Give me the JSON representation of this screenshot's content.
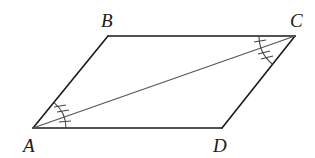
{
  "figure": {
    "type": "parallelogram",
    "vertices": {
      "A": {
        "label": "A",
        "x": 33,
        "y": 128
      },
      "B": {
        "label": "B",
        "x": 108,
        "y": 36
      },
      "C": {
        "label": "C",
        "x": 295,
        "y": 36
      },
      "D": {
        "label": "D",
        "x": 222,
        "y": 128
      }
    },
    "diagonal": "AC",
    "angle_marks": {
      "A_upper": {
        "between": "BAC",
        "ticks": 2
      },
      "A_lower": {
        "between": "CAD",
        "ticks": 1
      },
      "C_upper": {
        "between": "BCA",
        "ticks": 1
      },
      "C_lower": {
        "between": "ACD",
        "ticks": 2
      }
    },
    "colors": {
      "stroke": "#1a1a1a",
      "diagonal": "#555555",
      "background": "#ffffff"
    }
  }
}
